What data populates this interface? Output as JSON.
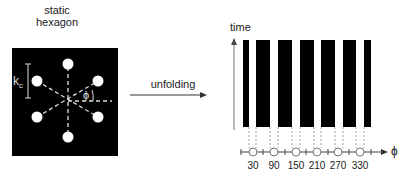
{
  "left_panel": {
    "title_line1": "static",
    "title_line2": "hexagon",
    "kc_label": "k",
    "kc_sub": "c",
    "phi_label": "ϕ"
  },
  "arrow": {
    "label": "unfolding"
  },
  "right_panel": {
    "y_axis_label": "time",
    "x_axis_label": "ϕ",
    "ticks": [
      "30",
      "90",
      "150",
      "210",
      "270",
      "330"
    ]
  },
  "colors": {
    "background": "#ffffff",
    "panel": "#000000",
    "spot": "#ffffff",
    "line": "#555555"
  }
}
